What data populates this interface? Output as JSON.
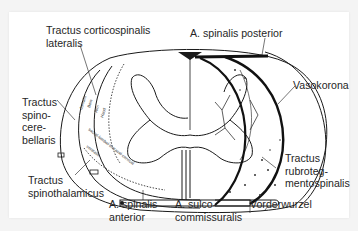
{
  "figure": {
    "labels": {
      "tractus_corticospinalis_lateralis": [
        "Tractus corticospinalis",
        "lateralis"
      ],
      "a_spinalis_posterior": "A. spinalis posterior",
      "vasokorona": "Vasokorona",
      "tractus_spinocerebellaris": [
        "Tractus",
        "spino-",
        "cere-",
        "bellaris"
      ],
      "tractus_spinothalamicus": [
        "Tractus",
        "spinothalamicus"
      ],
      "a_spinalis_anterior": [
        "A. spinalis",
        "anterior"
      ],
      "a_sulcocommissuralis": [
        "A. sulco-",
        "commissuralis"
      ],
      "vorderwurzel": "Vorderwurzel",
      "tractus_rubrotegmentospinalis": [
        "Tractus",
        "rubroteg-",
        "mentospinalis"
      ]
    },
    "inner_labels": {
      "dorsalis": "dorsalis",
      "bein": "Bein",
      "arm": "Arm",
      "hand": "Hand",
      "segments": "sacral-lumbal-thoracal-cervical",
      "ventralis": "ventralis"
    },
    "colors": {
      "line": "#1a1a1a",
      "text": "#262626",
      "background": "#ffffff"
    }
  }
}
